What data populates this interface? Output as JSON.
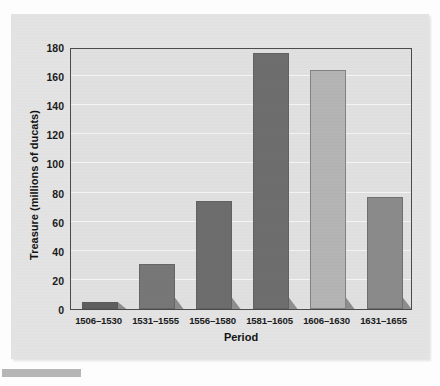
{
  "chart_data": {
    "type": "bar",
    "title": "",
    "xlabel": "Period",
    "ylabel": "Treasure (millions of ducats)",
    "categories": [
      "1506–1530",
      "1531–1555",
      "1556–1580",
      "1581–1605",
      "1606–1630",
      "1631–1655"
    ],
    "values": [
      5,
      31,
      74,
      176,
      164,
      77
    ],
    "ylim": [
      0,
      180
    ],
    "yticks": [
      0,
      20,
      40,
      60,
      80,
      100,
      120,
      140,
      160,
      180
    ],
    "ytick_labels": [
      "0",
      "20",
      "40",
      "60",
      "80",
      "100",
      "120",
      "140",
      "160",
      "180"
    ],
    "bar_colors": [
      "#5f5f5f",
      "#777777",
      "#6d6d6d",
      "#6e6e6e",
      "#b4b4b4",
      "#8a8a8a"
    ],
    "grid": "horizontal",
    "legend": "none",
    "gridline_color": "#f4f4f4",
    "axis_color": "#4b4b4b",
    "plot_background": "#e0e0e0",
    "figure_background": "#e3e3e3",
    "shadow_color": "#8d8d8d"
  },
  "axis": {
    "x_title": "Period",
    "y_title": "Treasure (millions of ducats)"
  }
}
